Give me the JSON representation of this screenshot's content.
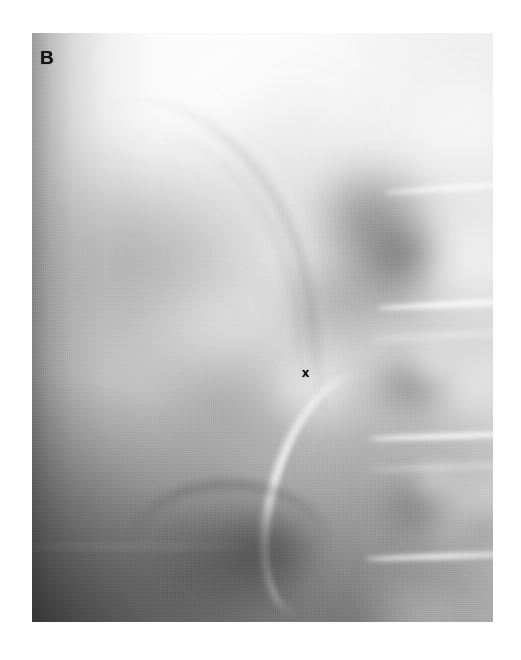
{
  "figure": {
    "panel_label": "B",
    "modality": "radiograph",
    "background_color": "#ffffff",
    "film": {
      "x": 32,
      "y": 33,
      "width": 461,
      "height": 589,
      "base_color": "#b9b9b9",
      "highlight_color": "#fdfdfd",
      "shadow_color": "#4a4a4a"
    }
  },
  "annotations": [
    {
      "name": "panel-label",
      "text": "B",
      "color": "#141414",
      "x": 40,
      "y": 48,
      "description": "panel letter at upper-left of the radiograph"
    },
    {
      "name": "x-marker",
      "text": "x",
      "color": "#0d0d0d",
      "x": 302,
      "y": 366,
      "description": "small x marker indicating a structure of interest in the mid-abdomen"
    }
  ],
  "regions": [
    {
      "name": "bright-soft-tissue-upper",
      "tone": "bright",
      "x": 60,
      "y": 40,
      "width": 320,
      "height": 190
    },
    {
      "name": "lumbar-vertebral-column",
      "tone": "bright",
      "x": 385,
      "y": 60,
      "width": 108,
      "height": 560
    },
    {
      "name": "renal-shadow-upper-right",
      "tone": "dark",
      "x": 300,
      "y": 160,
      "width": 130,
      "height": 150
    },
    {
      "name": "bowel-gas-lower-left",
      "tone": "dark",
      "x": 120,
      "y": 460,
      "width": 200,
      "height": 150
    },
    {
      "name": "contrast-filled-ureter",
      "tone": "bright",
      "x": 290,
      "y": 385,
      "width": 75,
      "height": 210
    },
    {
      "name": "left-edge-exposure-falloff",
      "tone": "dark",
      "x": 32,
      "y": 200,
      "width": 60,
      "height": 420
    }
  ]
}
